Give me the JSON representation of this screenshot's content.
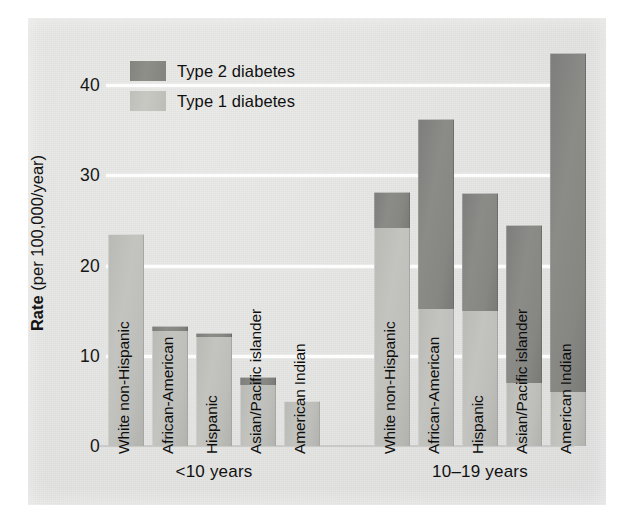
{
  "chart_data": {
    "type": "bar",
    "stacked": true,
    "title": "",
    "xlabel": "",
    "ylabel": "Rate (per 100,000/year)",
    "ylabel_bold_part": "Rate",
    "ylabel_rest": " (per 100,000/year)",
    "ylim": [
      0,
      45
    ],
    "yticks": [
      0,
      10,
      20,
      30,
      40
    ],
    "ytick_labels": [
      "0",
      "10",
      "20",
      "30",
      "40"
    ],
    "grid": "horizontal",
    "legend_position": "top-left-inside",
    "legend": [
      {
        "label": "Type 2 diabetes",
        "color": "#87877f",
        "key": "type2"
      },
      {
        "label": "Type 1 diabetes",
        "color": "#c2c2bd",
        "key": "type1"
      }
    ],
    "series": [
      {
        "name": "Type 1 diabetes",
        "color": "#c2c2bd",
        "values": [
          23.5,
          12.8,
          12.1,
          6.8,
          5.0,
          24.2,
          15.2,
          15.0,
          7.0,
          6.0
        ]
      },
      {
        "name": "Type 2 diabetes",
        "color": "#87877f",
        "values": [
          0.0,
          0.5,
          0.4,
          0.9,
          0.0,
          4.0,
          21.0,
          13.0,
          17.5,
          37.6
        ]
      }
    ],
    "groups": [
      {
        "label": "<10 years",
        "categories": [
          {
            "label": "White non-Hispanic",
            "type1": 23.5,
            "type2": 0.0,
            "total": 23.5
          },
          {
            "label": "African-American",
            "type1": 12.8,
            "type2": 0.5,
            "total": 13.3
          },
          {
            "label": "Hispanic",
            "type1": 12.1,
            "type2": 0.4,
            "total": 12.5
          },
          {
            "label": "Asian/Pacific islander",
            "type1": 6.8,
            "type2": 0.9,
            "total": 7.7
          },
          {
            "label": "American Indian",
            "type1": 5.0,
            "type2": 0.0,
            "total": 5.0
          }
        ]
      },
      {
        "label": "10–19 years",
        "categories": [
          {
            "label": "White non-Hispanic",
            "type1": 24.2,
            "type2": 4.0,
            "total": 28.2
          },
          {
            "label": "African-American",
            "type1": 15.2,
            "type2": 21.0,
            "total": 36.2
          },
          {
            "label": "Hispanic",
            "type1": 15.0,
            "type2": 13.0,
            "total": 28.0
          },
          {
            "label": "Asian/Pacific islander",
            "type1": 7.0,
            "type2": 17.5,
            "total": 24.5
          },
          {
            "label": "American Indian",
            "type1": 6.0,
            "type2": 37.6,
            "total": 43.6
          }
        ]
      }
    ]
  },
  "colors": {
    "background": "#e5e5e3",
    "gridline": "#fdfdfd",
    "type1": "#c2c2bd",
    "type2": "#87877f",
    "text": "#111111"
  }
}
